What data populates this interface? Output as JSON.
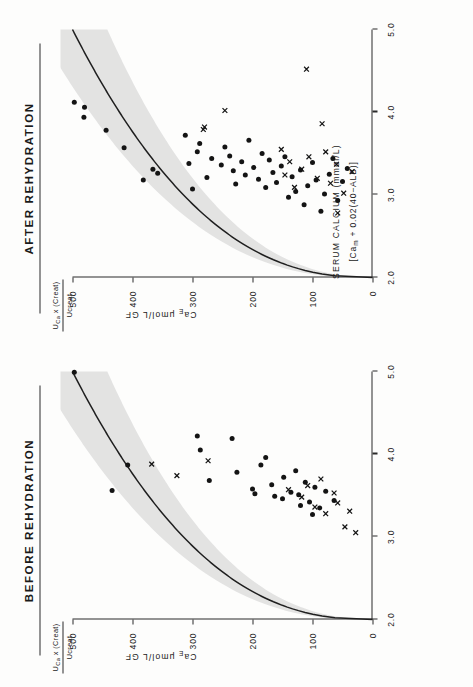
{
  "figure": {
    "panels": [
      {
        "id": "before",
        "title": "BEFORE  REHYDRATION"
      },
      {
        "id": "after",
        "title": "AFTER  REHYDRATION"
      }
    ],
    "yaxis": {
      "fraction_numerator": "U₁ₐ x (Creat)",
      "fraction_numerator_plain": "UCa x (Creat)",
      "fraction_denominator": "Ucreat",
      "title_prefix": "Ca",
      "title_sub": "E",
      "title_suffix": " μmol/L GF",
      "ticks": [
        "500",
        "400",
        "300",
        "200",
        "100",
        "0"
      ],
      "tick_values": [
        500,
        400,
        300,
        200,
        100,
        0
      ],
      "range": [
        0,
        500
      ]
    },
    "xaxis": {
      "title_line1": "SERUM CALCIUM (mmol/L)",
      "title_line2_prefix": "[Ca",
      "title_line2_sub": "m",
      "title_line2_suffix": " + 0.02(40−ALB)]",
      "ticks": [
        "2.0",
        "3.0",
        "4.0",
        "5.0"
      ],
      "tick_values": [
        2.0,
        3.0,
        4.0,
        5.0
      ],
      "range": [
        2.0,
        5.0
      ]
    }
  },
  "chart_data": [
    {
      "type": "scatter",
      "title": "BEFORE  REHYDRATION",
      "xlabel": "SERUM CALCIUM (mmol/L) [Cam + 0.02(40-ALB)]",
      "ylabel": "CaE μmol/L GF",
      "xlim": [
        2.0,
        5.0
      ],
      "ylim": [
        0,
        500
      ],
      "grid": false,
      "legend": "none",
      "series": [
        {
          "name": "dot",
          "marker": "filled-circle",
          "points": [
            [
              4.99,
              497
            ],
            [
              3.56,
              434
            ],
            [
              3.87,
              408
            ],
            [
              4.22,
              292
            ],
            [
              4.05,
              287
            ],
            [
              3.68,
              272
            ],
            [
              4.19,
              234
            ],
            [
              3.78,
              226
            ],
            [
              3.87,
              186
            ],
            [
              3.96,
              178
            ],
            [
              3.58,
              200
            ],
            [
              3.52,
              196
            ],
            [
              3.63,
              168
            ],
            [
              3.49,
              163
            ],
            [
              3.46,
              150
            ],
            [
              3.72,
              148
            ],
            [
              3.54,
              136
            ],
            [
              3.8,
              128
            ],
            [
              3.51,
              123
            ],
            [
              3.38,
              120
            ],
            [
              3.66,
              112
            ],
            [
              3.42,
              105
            ],
            [
              3.27,
              100
            ],
            [
              3.6,
              96
            ],
            [
              3.35,
              88
            ],
            [
              3.55,
              78
            ],
            [
              3.44,
              64
            ]
          ]
        },
        {
          "name": "cross",
          "marker": "cross",
          "points": [
            [
              3.88,
              368
            ],
            [
              3.74,
              326
            ],
            [
              3.92,
              274
            ],
            [
              3.57,
              140
            ],
            [
              3.48,
              118
            ],
            [
              3.62,
              108
            ],
            [
              3.36,
              96
            ],
            [
              3.7,
              86
            ],
            [
              3.28,
              78
            ],
            [
              3.53,
              64
            ],
            [
              3.41,
              58
            ],
            [
              3.12,
              46
            ],
            [
              3.31,
              38
            ],
            [
              3.05,
              28
            ]
          ]
        }
      ],
      "fit": {
        "name": "fitted curve with 95% band",
        "description": "monotonic rise from (2.0, 0) flattening toward high serum calcium",
        "band": "shaded grey confidence envelope"
      }
    },
    {
      "type": "scatter",
      "title": "AFTER  REHYDRATION",
      "xlabel": "SERUM CALCIUM (mmol/L) [Cam + 0.02(40-ALB)]",
      "ylabel": "CaE μmol/L GF",
      "xlim": [
        2.0,
        5.0
      ],
      "ylim": [
        0,
        500
      ],
      "grid": false,
      "legend": "none",
      "series": [
        {
          "name": "dot",
          "marker": "filled-circle",
          "points": [
            [
              4.12,
              497
            ],
            [
              4.06,
              480
            ],
            [
              3.94,
              481
            ],
            [
              3.78,
              444
            ],
            [
              3.57,
              414
            ],
            [
              3.18,
              382
            ],
            [
              3.31,
              366
            ],
            [
              3.26,
              358
            ],
            [
              3.72,
              312
            ],
            [
              3.38,
              306
            ],
            [
              3.07,
              300
            ],
            [
              3.52,
              292
            ],
            [
              3.62,
              288
            ],
            [
              3.21,
              276
            ],
            [
              3.44,
              268
            ],
            [
              3.36,
              252
            ],
            [
              3.58,
              246
            ],
            [
              3.47,
              238
            ],
            [
              3.29,
              232
            ],
            [
              3.13,
              228
            ],
            [
              3.4,
              218
            ],
            [
              3.24,
              212
            ],
            [
              3.66,
              206
            ],
            [
              3.33,
              198
            ],
            [
              3.19,
              190
            ],
            [
              3.5,
              184
            ],
            [
              3.09,
              178
            ],
            [
              3.42,
              172
            ],
            [
              3.27,
              166
            ],
            [
              3.15,
              160
            ],
            [
              3.35,
              152
            ],
            [
              3.46,
              146
            ],
            [
              2.97,
              140
            ],
            [
              3.22,
              134
            ],
            [
              3.04,
              128
            ],
            [
              3.3,
              120
            ],
            [
              2.88,
              114
            ],
            [
              3.11,
              108
            ],
            [
              3.39,
              100
            ],
            [
              3.18,
              94
            ],
            [
              2.8,
              86
            ],
            [
              3.01,
              80
            ],
            [
              3.25,
              72
            ],
            [
              3.44,
              66
            ],
            [
              2.93,
              58
            ],
            [
              3.16,
              50
            ],
            [
              3.32,
              42
            ]
          ]
        },
        {
          "name": "cross",
          "marker": "cross",
          "points": [
            [
              4.52,
              110
            ],
            [
              4.02,
              246
            ],
            [
              3.82,
              280
            ],
            [
              3.79,
              282
            ],
            [
              3.86,
              84
            ],
            [
              3.55,
              152
            ],
            [
              3.4,
              138
            ],
            [
              3.24,
              146
            ],
            [
              3.31,
              118
            ],
            [
              3.46,
              106
            ],
            [
              3.09,
              130
            ],
            [
              2.78,
              58
            ],
            [
              3.2,
              92
            ],
            [
              3.52,
              78
            ],
            [
              3.14,
              70
            ],
            [
              3.37,
              60
            ],
            [
              3.02,
              48
            ],
            [
              3.28,
              34
            ]
          ]
        }
      ],
      "fit": {
        "name": "fitted curve with 95% band",
        "description": "monotonic rise from (2.0, 0) flattening toward high serum calcium",
        "band": "shaded grey confidence envelope"
      }
    }
  ]
}
